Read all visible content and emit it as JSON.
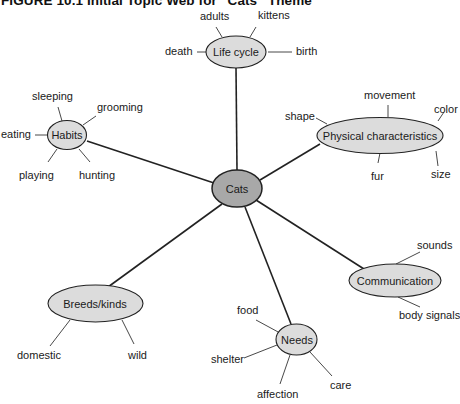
{
  "figure": {
    "title": "FIGURE 10.1   Initial Topic Web for “Cats” Theme"
  },
  "colors": {
    "node_fill": "#dcdcdc",
    "center_fill": "#a8a8a8",
    "stroke": "#222222"
  },
  "center": {
    "label": "Cats"
  },
  "nodes": {
    "life_cycle": {
      "label": "Life cycle",
      "leaves": [
        "adults",
        "kittens",
        "death",
        "birth"
      ]
    },
    "habits": {
      "label": "Habits",
      "leaves": [
        "sleeping",
        "grooming",
        "eating",
        "playing",
        "hunting"
      ]
    },
    "physical": {
      "label": "Physical characteristics",
      "leaves": [
        "movement",
        "shape",
        "color",
        "fur",
        "size"
      ]
    },
    "communication": {
      "label": "Communication",
      "leaves": [
        "sounds",
        "body signals"
      ]
    },
    "breeds": {
      "label": "Breeds/kinds",
      "leaves": [
        "domestic",
        "wild"
      ]
    },
    "needs": {
      "label": "Needs",
      "leaves": [
        "food",
        "shelter",
        "affection",
        "care"
      ]
    }
  }
}
